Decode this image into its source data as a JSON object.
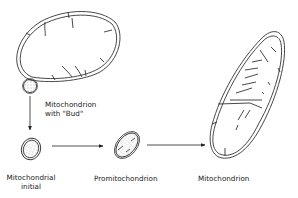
{
  "diagram": {
    "nodes": [
      {
        "id": "parent",
        "label": "Mitochondrion with \"Bud\""
      },
      {
        "id": "initial",
        "label": "Mitochondrial initial"
      },
      {
        "id": "promito",
        "label": "Promitochondrion"
      },
      {
        "id": "mito",
        "label": "Mitochondrion"
      }
    ],
    "edges": [
      {
        "from": "parent",
        "to": "initial"
      },
      {
        "from": "initial",
        "to": "promito"
      },
      {
        "from": "promito",
        "to": "mito"
      }
    ],
    "labels": {
      "bud_line1": "Mitochondrion",
      "bud_line2": "with \"Bud\"",
      "initial_line1": "Mitochondrial",
      "initial_line2": "initial",
      "promito": "Promitochondrion",
      "mito": "Mitochondrion"
    },
    "colors": {
      "stroke": "#333333",
      "background": "#ffffff"
    }
  }
}
